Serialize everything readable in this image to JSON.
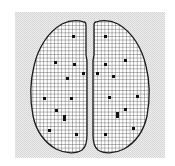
{
  "figure": {
    "width": 175,
    "height": 166,
    "colors": {
      "page_background": "#ffffff",
      "panel_background": "#e4e4e4",
      "outline": "#1a1a1a",
      "grid_line": "#3a3a3a",
      "fill": "#ffffff",
      "marker": "#111111"
    },
    "panel": {
      "x": 15,
      "y": 12,
      "w": 150,
      "h": 146
    },
    "grid_cell_px": 3.6,
    "hemispheres": [
      {
        "name": "left-hemisphere",
        "path": "M84,22 C78,20 70,20 62,24 C48,32 38,48 34,66 C30,82 30,100 33,116 C36,130 44,142 56,149 C66,154 76,154 82,150 C86,147 87,140 87,135 L87,62 C87,58 86,57 86,54 L86,26 C86,23 85,22 84,22 Z"
      },
      {
        "name": "right-hemisphere",
        "path": "M96,22 C102,20 110,20 118,24 C132,32 142,48 146,66 C150,82 150,100 147,116 C144,130 136,142 124,149 C114,154 104,154 98,150 C94,147 93,140 93,135 L93,62 C93,58 94,57 94,54 L94,26 C94,23 95,22 96,22 Z"
      }
    ],
    "markers": [
      {
        "hemisphere": "left",
        "x": 72,
        "y": 35,
        "w": 3,
        "h": 3
      },
      {
        "hemisphere": "left",
        "x": 54,
        "y": 61,
        "w": 3,
        "h": 3
      },
      {
        "hemisphere": "left",
        "x": 73,
        "y": 63,
        "w": 3,
        "h": 3
      },
      {
        "hemisphere": "left",
        "x": 82,
        "y": 72,
        "w": 3,
        "h": 3
      },
      {
        "hemisphere": "left",
        "x": 66,
        "y": 77,
        "w": 3,
        "h": 3
      },
      {
        "hemisphere": "left",
        "x": 43,
        "y": 97,
        "w": 3,
        "h": 3
      },
      {
        "hemisphere": "left",
        "x": 70,
        "y": 97,
        "w": 3,
        "h": 3
      },
      {
        "hemisphere": "left",
        "x": 55,
        "y": 109,
        "w": 3,
        "h": 3
      },
      {
        "hemisphere": "left",
        "x": 63,
        "y": 115,
        "w": 3,
        "h": 6
      },
      {
        "hemisphere": "left",
        "x": 48,
        "y": 129,
        "w": 3,
        "h": 3
      },
      {
        "hemisphere": "left",
        "x": 75,
        "y": 133,
        "w": 3,
        "h": 3
      },
      {
        "hemisphere": "right",
        "x": 104,
        "y": 35,
        "w": 3,
        "h": 3
      },
      {
        "hemisphere": "right",
        "x": 124,
        "y": 59,
        "w": 3,
        "h": 3
      },
      {
        "hemisphere": "right",
        "x": 104,
        "y": 63,
        "w": 3,
        "h": 3
      },
      {
        "hemisphere": "right",
        "x": 96,
        "y": 72,
        "w": 3,
        "h": 3
      },
      {
        "hemisphere": "right",
        "x": 112,
        "y": 75,
        "w": 3,
        "h": 3
      },
      {
        "hemisphere": "right",
        "x": 108,
        "y": 96,
        "w": 3,
        "h": 3
      },
      {
        "hemisphere": "right",
        "x": 136,
        "y": 95,
        "w": 3,
        "h": 3
      },
      {
        "hemisphere": "right",
        "x": 124,
        "y": 108,
        "w": 3,
        "h": 3
      },
      {
        "hemisphere": "right",
        "x": 116,
        "y": 112,
        "w": 3,
        "h": 6
      },
      {
        "hemisphere": "right",
        "x": 132,
        "y": 127,
        "w": 3,
        "h": 3
      },
      {
        "hemisphere": "right",
        "x": 104,
        "y": 133,
        "w": 3,
        "h": 3
      }
    ]
  }
}
